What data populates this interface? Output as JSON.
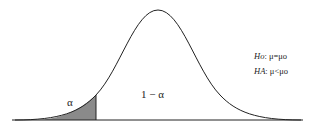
{
  "diagram": {
    "type": "normal-distribution-left-tail-test",
    "labels": {
      "alpha": "α",
      "one_minus_alpha": "1 − α"
    },
    "hypotheses": {
      "h0_symbol": "Ho",
      "h0_text": ": μ=μo",
      "ha_symbol": "HA",
      "ha_text": ": μ<μo"
    },
    "colors": {
      "curve": "#222222",
      "shaded_region": "#8a8a8a",
      "background": "#ffffff"
    }
  }
}
